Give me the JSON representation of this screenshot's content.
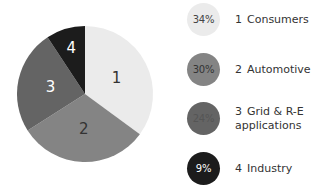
{
  "chart_data": {
    "type": "pie",
    "title": "",
    "start_angle_deg": 0,
    "direction": "clockwise",
    "slices": [
      {
        "id": "1",
        "label": "Consumers",
        "value": 34,
        "display": "34%",
        "color": "#ebebeb",
        "text_color": "#333333"
      },
      {
        "id": "2",
        "label": "Automotive",
        "value": 30,
        "display": "30%",
        "color": "#848484",
        "text_color": "#333333"
      },
      {
        "id": "3",
        "label": "Grid & R-E applications",
        "value": 24,
        "display": "24%",
        "color": "#646464",
        "text_color": "#ffffff"
      },
      {
        "id": "4",
        "label": "Industry",
        "value": 9,
        "display": "9%",
        "color": "#1c1c1c",
        "text_color": "#ffffff"
      }
    ],
    "legend_position": "right"
  },
  "legend": {
    "items": [
      {
        "number": "1",
        "text": "Consumers",
        "text_line2": "",
        "badge": "34%",
        "badge_color": "#ebebeb",
        "badge_text_color": "#444444"
      },
      {
        "number": "2",
        "text": "Automotive",
        "text_line2": "",
        "badge": "30%",
        "badge_color": "#848484",
        "badge_text_color": "#333333"
      },
      {
        "number": "3",
        "text": "Grid & R-E",
        "text_line2": "applications",
        "badge": "24%",
        "badge_color": "#646464",
        "badge_text_color": "#555555"
      },
      {
        "number": "4",
        "text": "Industry",
        "text_line2": "",
        "badge": "9%",
        "badge_color": "#1c1c1c",
        "badge_text_color": "#ffffff"
      }
    ]
  }
}
